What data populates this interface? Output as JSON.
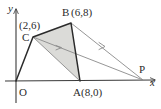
{
  "figure": {
    "type": "geometry-diagram",
    "axes": {
      "x_label": "x",
      "y_label": "y",
      "origin_label": "O"
    },
    "points": [
      {
        "name": "O",
        "label": "O",
        "coord_label": "",
        "x": 0,
        "y": 0,
        "px": 16,
        "py": 81
      },
      {
        "name": "C",
        "label": "C",
        "coord_label": "(2,6)",
        "x": 2,
        "y": 6,
        "px": 33,
        "py": 37
      },
      {
        "name": "B",
        "label": "B",
        "coord_label": "(6,8)",
        "x": 6,
        "y": 8,
        "px": 71,
        "py": 23
      },
      {
        "name": "A",
        "label": "A",
        "coord_label": "(8,0)",
        "x": 8,
        "y": 0,
        "px": 80,
        "py": 81
      },
      {
        "name": "P",
        "label": "P",
        "coord_label": "",
        "x": 14.5,
        "y": 0,
        "px": 143,
        "py": 80
      }
    ],
    "shaded_region": {
      "vertices": [
        "C",
        "B",
        "A"
      ],
      "fill": "#d9d9d6"
    },
    "segments": [
      {
        "from": "O",
        "to": "C",
        "style": "solid-dark"
      },
      {
        "from": "C",
        "to": "B",
        "style": "solid-dark"
      },
      {
        "from": "B",
        "to": "A",
        "style": "solid-dark"
      },
      {
        "from": "A",
        "to": "O",
        "style": "axis"
      },
      {
        "from": "C",
        "to": "A",
        "style": "thin-gray"
      },
      {
        "from": "C",
        "to": "P",
        "style": "thin-gray-arrow"
      },
      {
        "from": "B",
        "to": "P",
        "style": "thin-gray-arrow"
      },
      {
        "from": "A",
        "to": "P",
        "style": "axis"
      }
    ],
    "arrow_marks": [
      {
        "on": "C-P",
        "direction": "toward-P"
      },
      {
        "on": "B-P",
        "direction": "toward-P"
      }
    ],
    "colors": {
      "stroke_dark": "#2b2b2b",
      "stroke_gray": "#808080",
      "fill_shade": "#d9d9d6",
      "background": "#ffffff"
    }
  }
}
